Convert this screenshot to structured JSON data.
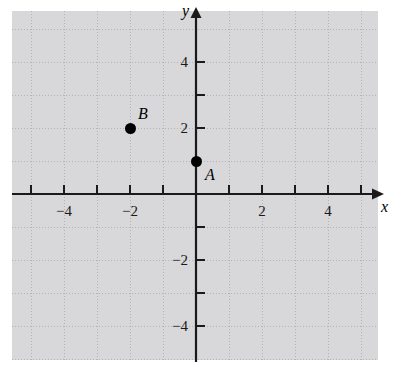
{
  "figure": {
    "kind": "cartesian-coordinate-plane",
    "background_color": "#ffffff",
    "axis_color": "#1a1a1a",
    "grid_color": "#b9b9bd",
    "point_color": "#000000"
  },
  "axes": {
    "x_axis_label": "x",
    "y_axis_label": "y",
    "x_ticks": [
      {
        "value": -5,
        "label": ""
      },
      {
        "value": -4,
        "label": "−4"
      },
      {
        "value": -3,
        "label": ""
      },
      {
        "value": -2,
        "label": "−2"
      },
      {
        "value": -1,
        "label": ""
      },
      {
        "value": 1,
        "label": ""
      },
      {
        "value": 2,
        "label": "2"
      },
      {
        "value": 3,
        "label": ""
      },
      {
        "value": 4,
        "label": "4"
      },
      {
        "value": 5,
        "label": ""
      }
    ],
    "y_ticks": [
      {
        "value": 4,
        "label": "4"
      },
      {
        "value": 3,
        "label": ""
      },
      {
        "value": 2,
        "label": "2"
      },
      {
        "value": -1,
        "label": ""
      },
      {
        "value": -2,
        "label": "−2"
      },
      {
        "value": -3,
        "label": ""
      },
      {
        "value": -4,
        "label": "−4"
      }
    ],
    "x_range": [
      -5.6,
      5.6
    ],
    "y_range": [
      -5.0,
      5.0
    ],
    "arrow_x_positive": true,
    "arrow_y_positive": true
  },
  "chart_data": {
    "type": "scatter",
    "title": "",
    "xlabel": "x",
    "ylabel": "y",
    "xlim": [
      -5.6,
      5.6
    ],
    "ylim": [
      -5.0,
      5.0
    ],
    "grid": true,
    "legend": "none",
    "x_ticklabels": [
      "−4",
      "−2",
      "2",
      "4"
    ],
    "y_ticklabels": [
      "4",
      "2",
      "−2",
      "−4"
    ],
    "points": [
      {
        "name": "A",
        "x": 0,
        "y": 1,
        "label": "A",
        "label_position": "right-below"
      },
      {
        "name": "B",
        "x": -2,
        "y": 2,
        "label": "B",
        "label_position": "right-above"
      }
    ]
  }
}
